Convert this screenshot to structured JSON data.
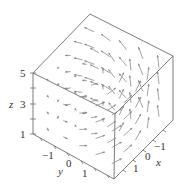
{
  "chart_data": {
    "type": "vector_field_3d",
    "title": "",
    "axes": {
      "x": {
        "label": "x",
        "ticks": [
          -1,
          0,
          1
        ],
        "range": [
          -1.5,
          1.5
        ]
      },
      "y": {
        "label": "y",
        "ticks": [
          -1,
          0,
          1
        ],
        "range": [
          -1.5,
          1.5
        ]
      },
      "z": {
        "label": "z",
        "ticks": [
          1,
          3,
          5
        ],
        "minor_ticks": [
          2,
          4
        ],
        "range": [
          1,
          5
        ]
      }
    },
    "projection": {
      "cube_vertices_px": {
        "top_back": [
          90,
          14
        ],
        "right_top": [
          173,
          56
        ],
        "front_top": [
          115,
          114
        ],
        "left_top": [
          33,
          73
        ],
        "left_bottom": [
          33,
          134
        ],
        "front_bottom": [
          114,
          179
        ],
        "right_bottom": [
          173,
          120
        ]
      }
    },
    "grid": false,
    "legend": null
  },
  "labels": {
    "z_axis": "z",
    "y_axis": "y",
    "x_axis": "x",
    "z_ticks": [
      "1",
      "3",
      "5"
    ],
    "y_ticks": [
      "−1",
      "0",
      "1"
    ],
    "x_ticks": [
      "−1",
      "0",
      "1"
    ]
  }
}
